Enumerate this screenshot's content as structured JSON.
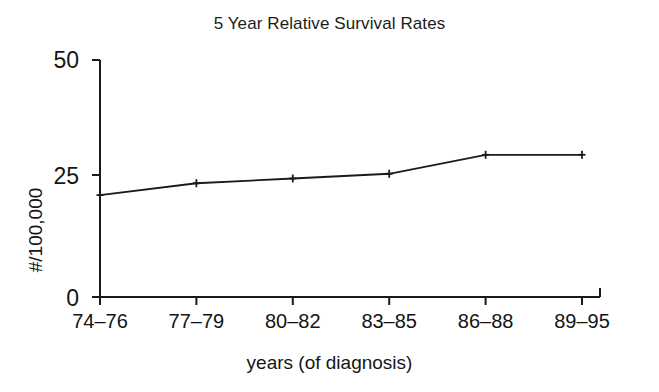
{
  "chart_data": {
    "type": "line",
    "title": "5 Year Relative Survival Rates",
    "xlabel": "years (of diagnosis)",
    "ylabel": "#/100,000",
    "categories": [
      "74–76",
      "77–79",
      "80–82",
      "83–85",
      "86–88",
      "89–95"
    ],
    "values": [
      21.5,
      24.0,
      25.0,
      26.0,
      30.0,
      30.0
    ],
    "yticks": [
      0,
      25,
      50
    ],
    "ytick_labels": [
      "0",
      "25",
      "50"
    ],
    "ylim": [
      0,
      50
    ],
    "grid": false,
    "legend": null,
    "series": [
      {
        "name": "5 Year Relative Survival Rates",
        "values": [
          21.5,
          24.0,
          25.0,
          26.0,
          30.0,
          30.0
        ],
        "color": "#1a1a1a",
        "marker": "plus"
      }
    ]
  },
  "figure": {
    "background_color": "#ffffff",
    "line_color": "#1a1a1a",
    "axis_color": "#1a1a1a"
  }
}
